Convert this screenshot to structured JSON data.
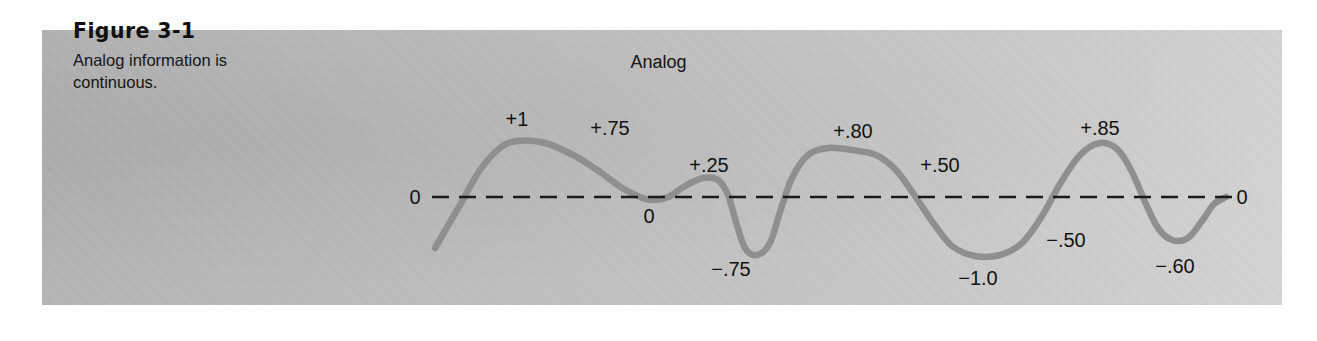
{
  "figure": {
    "number": "Figure 3-1",
    "caption": "Analog information is continuous.",
    "title": "Analog"
  },
  "colors": {
    "panel_light": "#d4d4d4",
    "panel_dark": "#b4b4b4",
    "curve": "#8f8f8f",
    "axis": "#1a1a1a",
    "text": "#121212",
    "page_background": "#ffffff"
  },
  "chart_data": {
    "type": "line",
    "title": "Analog",
    "xlabel": "",
    "ylabel": "",
    "grid": false,
    "legend": "none",
    "ylim": [
      -1.0,
      1.0
    ],
    "baseline": 0,
    "baseline_style": "dashed",
    "annotations": [
      {
        "label": "0",
        "value": 0.0,
        "position": "baseline-left",
        "x": 415,
        "y": 197
      },
      {
        "label": "+1",
        "value": 1.0,
        "position": "above-peak",
        "x": 517,
        "y": 119
      },
      {
        "label": "+.75",
        "value": 0.75,
        "position": "above-curve",
        "x": 610,
        "y": 128
      },
      {
        "label": "0",
        "value": 0.0,
        "position": "below-curve",
        "x": 649,
        "y": 216
      },
      {
        "label": "+.25",
        "value": 0.25,
        "position": "above-peak",
        "x": 709,
        "y": 165
      },
      {
        "label": "-.75",
        "value": -0.75,
        "position": "below-trough",
        "x": 731,
        "y": 269
      },
      {
        "label": "+.80",
        "value": 0.8,
        "position": "above-peak",
        "x": 853,
        "y": 131
      },
      {
        "label": "+.50",
        "value": 0.5,
        "position": "above-curve",
        "x": 940,
        "y": 165
      },
      {
        "label": "-1.0",
        "value": -1.0,
        "position": "below-trough",
        "x": 978,
        "y": 278
      },
      {
        "label": "+.85",
        "value": 0.85,
        "position": "above-peak",
        "x": 1100,
        "y": 128
      },
      {
        "label": "-.50",
        "value": -0.5,
        "position": "right-of-curve",
        "x": 1066,
        "y": 240
      },
      {
        "label": "-.60",
        "value": -0.6,
        "position": "below-trough",
        "x": 1175,
        "y": 266
      },
      {
        "label": "0",
        "value": 0.0,
        "position": "baseline-right",
        "x": 1242,
        "y": 197
      }
    ],
    "curve_points": [
      {
        "x": 435,
        "y": 248
      },
      {
        "x": 460,
        "y": 205
      },
      {
        "x": 480,
        "y": 170
      },
      {
        "x": 500,
        "y": 148
      },
      {
        "x": 517,
        "y": 141
      },
      {
        "x": 545,
        "y": 143
      },
      {
        "x": 575,
        "y": 156
      },
      {
        "x": 600,
        "y": 172
      },
      {
        "x": 622,
        "y": 188
      },
      {
        "x": 640,
        "y": 197
      },
      {
        "x": 652,
        "y": 200
      },
      {
        "x": 668,
        "y": 197
      },
      {
        "x": 685,
        "y": 186
      },
      {
        "x": 703,
        "y": 178
      },
      {
        "x": 718,
        "y": 180
      },
      {
        "x": 728,
        "y": 195
      },
      {
        "x": 736,
        "y": 222
      },
      {
        "x": 745,
        "y": 248
      },
      {
        "x": 757,
        "y": 255
      },
      {
        "x": 770,
        "y": 243
      },
      {
        "x": 780,
        "y": 212
      },
      {
        "x": 792,
        "y": 178
      },
      {
        "x": 808,
        "y": 155
      },
      {
        "x": 828,
        "y": 148
      },
      {
        "x": 852,
        "y": 150
      },
      {
        "x": 876,
        "y": 155
      },
      {
        "x": 896,
        "y": 170
      },
      {
        "x": 915,
        "y": 196
      },
      {
        "x": 934,
        "y": 224
      },
      {
        "x": 952,
        "y": 246
      },
      {
        "x": 975,
        "y": 256
      },
      {
        "x": 1000,
        "y": 255
      },
      {
        "x": 1022,
        "y": 243
      },
      {
        "x": 1042,
        "y": 216
      },
      {
        "x": 1060,
        "y": 184
      },
      {
        "x": 1080,
        "y": 155
      },
      {
        "x": 1100,
        "y": 143
      },
      {
        "x": 1118,
        "y": 150
      },
      {
        "x": 1132,
        "y": 172
      },
      {
        "x": 1146,
        "y": 204
      },
      {
        "x": 1158,
        "y": 228
      },
      {
        "x": 1172,
        "y": 240
      },
      {
        "x": 1188,
        "y": 238
      },
      {
        "x": 1202,
        "y": 221
      },
      {
        "x": 1214,
        "y": 204
      },
      {
        "x": 1226,
        "y": 197
      }
    ],
    "baseline_segment": {
      "x_start": 432,
      "x_end": 1232,
      "y": 197
    }
  }
}
